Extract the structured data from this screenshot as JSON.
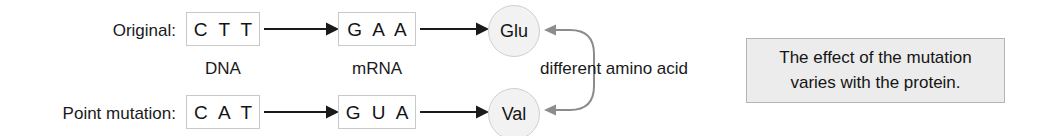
{
  "diagram": {
    "rows": [
      {
        "label": "Original:",
        "dna_codon": "C T T",
        "mrna_codon": "G A A",
        "amino_acid": "Glu"
      },
      {
        "label": "Point mutation:",
        "dna_codon": "C A T",
        "mrna_codon": "G U A",
        "amino_acid": "Val"
      }
    ],
    "column_labels": {
      "dna": "DNA",
      "mrna": "mRNA"
    },
    "connector_label": "different amino acid",
    "note": {
      "line1": "The effect of the mutation",
      "line2": "varies with the protein."
    },
    "colors": {
      "background": "#ffffff",
      "text": "#1a1a1a",
      "codon_box_border": "#c9c9c9",
      "codon_box_fill": "#ffffff",
      "circle_border": "#cfcfcf",
      "circle_fill": "#f2f2f2",
      "arrow": "#1a1a1a",
      "connector": "#8c8c8c",
      "note_border": "#b4b4b4",
      "note_fill": "#ececec"
    }
  }
}
